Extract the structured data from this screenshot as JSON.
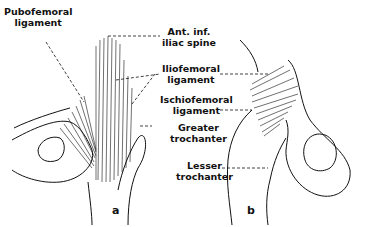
{
  "labels": {
    "pubofemoral": [
      "Pubofemoral",
      "ligament"
    ],
    "ant_inf_iliac": [
      "Ant. inf.",
      "iliac spine"
    ],
    "iliofemoral": [
      "Iliofemoral",
      "ligament"
    ],
    "ischiofemoral": [
      "Ischiofemoral",
      "ligament"
    ],
    "greater_trochanter": [
      "Greater",
      "trochanter"
    ],
    "lesser_trochanter": [
      "Lesser",
      "trochanter"
    ]
  },
  "panels": {
    "a": "a",
    "b": "b"
  },
  "colors": {
    "ink": "#111111",
    "background": "#ffffff"
  }
}
